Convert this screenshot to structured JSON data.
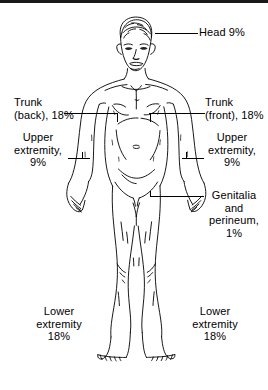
{
  "diagram": {
    "ink_color": "#000000",
    "background_color": "#ffffff"
  },
  "labels": {
    "head": {
      "text": "Head 9%",
      "region": "head",
      "percent": "9%"
    },
    "trunk_back": {
      "text": "Trunk\n(back), 18%",
      "region": "trunk (back)",
      "percent": "18%"
    },
    "trunk_front": {
      "text": "Trunk\n(front), 18%",
      "region": "trunk (front)",
      "percent": "18%"
    },
    "upper_extremity_left": {
      "text": "Upper\nextremity,\n9%",
      "region": "upper extremity",
      "percent": "9%"
    },
    "upper_extremity_right": {
      "text": "Upper\nextremity,\n9%",
      "region": "upper extremity",
      "percent": "9%"
    },
    "genitalia": {
      "text": "Genitalia\nand\nperineum,\n1%",
      "region": "genitalia and perineum",
      "percent": "1%"
    },
    "lower_extremity_left": {
      "text": "Lower\nextremity\n18%",
      "region": "lower extremity",
      "percent": "18%"
    },
    "lower_extremity_right": {
      "text": "Lower\nextremity\n18%",
      "region": "lower extremity",
      "percent": "18%"
    }
  }
}
